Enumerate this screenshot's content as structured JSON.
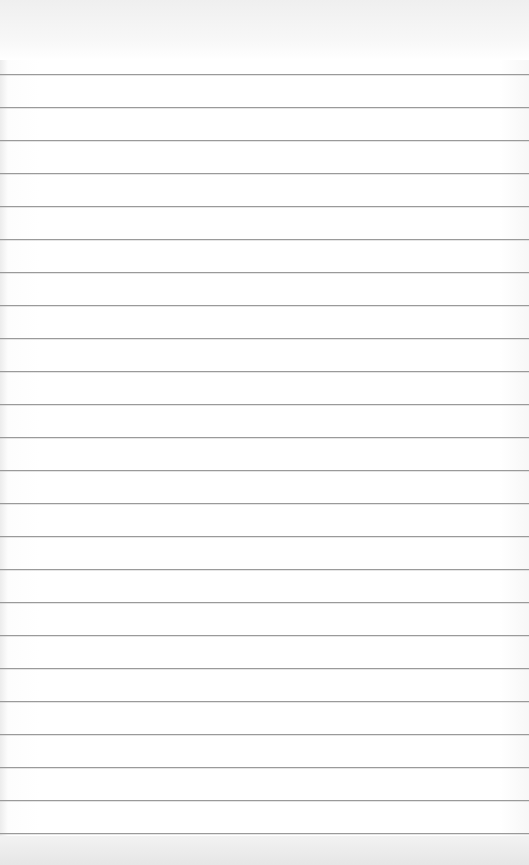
{
  "page": {
    "type": "lined-paper",
    "background_color": "#ffffff",
    "line_color": "#9a9a9a",
    "first_line_y": 74,
    "line_spacing": 33,
    "line_count": 24,
    "text_content": ""
  }
}
